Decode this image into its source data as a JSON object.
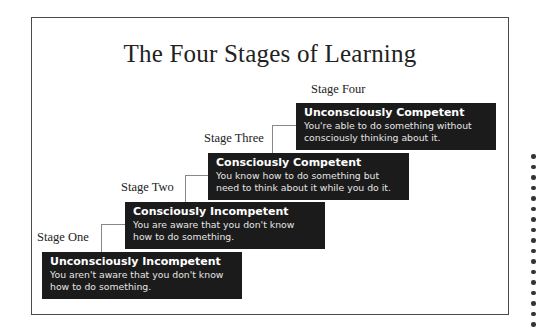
{
  "diagram": {
    "title": "The Four Stages of Learning",
    "stages": [
      {
        "label": "Stage One",
        "heading": "Unconsciously Incompetent",
        "desc_line1": "You aren't aware that you don't know",
        "desc_line2": "how to do something."
      },
      {
        "label": "Stage Two",
        "heading": "Consciously Incompetent",
        "desc_line1": "You are aware that you don't know",
        "desc_line2": "how to do something."
      },
      {
        "label": "Stage Three",
        "heading": "Consciously Competent",
        "desc_line1": "You know how to do something but",
        "desc_line2": "need to think about it while you do it."
      },
      {
        "label": "Stage Four",
        "heading": "Unconsciously Competent",
        "desc_line1": "You're able to do something without",
        "desc_line2": "consciously thinking about it."
      }
    ],
    "colors": {
      "box_background": "#1b1b1b",
      "box_text": "#ffffff",
      "connector": "#888888",
      "frame_border": "#4a4a4a"
    }
  }
}
